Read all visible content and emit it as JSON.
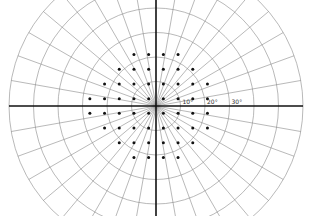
{
  "diagram": {
    "title": "Visual field test grid",
    "center": {
      "x": 156,
      "y": 106
    },
    "px_per_degree": 2.45,
    "rings_deg": [
      10,
      20,
      30,
      40,
      50,
      60
    ],
    "spoke_step_deg": 10,
    "axis_labels": [
      {
        "text": "10°",
        "deg": 10
      },
      {
        "text": "20°",
        "deg": 20
      },
      {
        "text": "30°",
        "deg": 30
      }
    ],
    "colors": {
      "grid": "#8a8a8a",
      "axis": "#111111",
      "dot": "#111111",
      "background": "#ffffff"
    },
    "test_points_deg": {
      "x_positions": [
        -27,
        -21,
        -15,
        -9,
        -3,
        3,
        9,
        15,
        21,
        27
      ],
      "rows": [
        {
          "y": 21,
          "x": [
            -9,
            -3,
            3,
            9
          ]
        },
        {
          "y": 15,
          "x": [
            -15,
            -9,
            -3,
            3,
            9,
            15
          ]
        },
        {
          "y": 9,
          "x": [
            -21,
            -15,
            -9,
            -3,
            3,
            9,
            15,
            21
          ]
        },
        {
          "y": 3,
          "x": [
            -27,
            -21,
            -15,
            -9,
            -3,
            3,
            9,
            15,
            21
          ]
        },
        {
          "y": -3,
          "x": [
            -27,
            -21,
            -15,
            -9,
            -3,
            3,
            9,
            15,
            21
          ]
        },
        {
          "y": -9,
          "x": [
            -21,
            -15,
            -9,
            -3,
            3,
            9,
            15,
            21
          ]
        },
        {
          "y": -15,
          "x": [
            -15,
            -9,
            -3,
            3,
            9,
            15
          ]
        },
        {
          "y": -21,
          "x": [
            -9,
            -3,
            3,
            9
          ]
        }
      ]
    }
  }
}
